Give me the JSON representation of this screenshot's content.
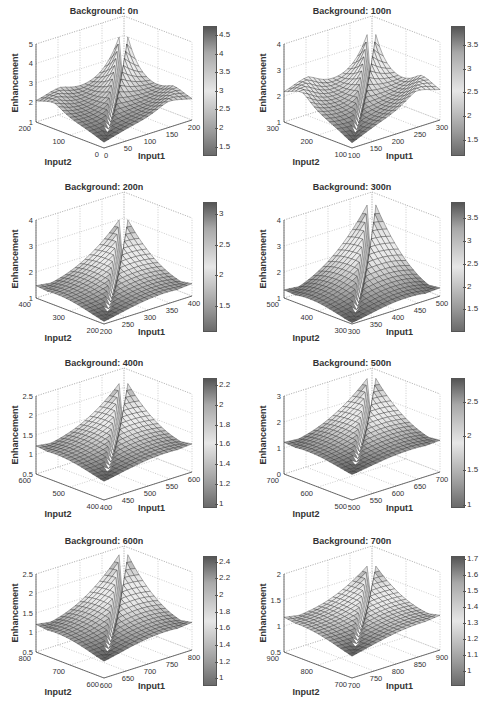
{
  "figure": {
    "panels": [
      {
        "title": "Background: 0n",
        "zlim": [
          1,
          5
        ],
        "zticks": [
          "1",
          "2",
          "3",
          "4",
          "5"
        ],
        "input1_ticks": [
          "0",
          "50",
          "100",
          "150",
          "200"
        ],
        "input2_ticks": [
          "0",
          "100",
          "200"
        ],
        "cbar_ticks": [
          "1.5",
          "2",
          "2.5",
          "3",
          "3.5",
          "4",
          "4.5"
        ],
        "cbar_range": [
          1.3,
          4.75
        ]
      },
      {
        "title": "Background: 100n",
        "zlim": [
          1,
          4
        ],
        "zticks": [
          "1",
          "2",
          "3",
          "4"
        ],
        "input1_ticks": [
          "100",
          "150",
          "200",
          "250",
          "300"
        ],
        "input2_ticks": [
          "100",
          "200",
          "300"
        ],
        "cbar_ticks": [
          "1.5",
          "2",
          "2.5",
          "3",
          "3.5"
        ],
        "cbar_range": [
          1.2,
          3.9
        ]
      },
      {
        "title": "Background: 200n",
        "zlim": [
          1,
          4
        ],
        "zticks": [
          "1",
          "2",
          "3",
          "4"
        ],
        "input1_ticks": [
          "200",
          "250",
          "300",
          "350",
          "400"
        ],
        "input2_ticks": [
          "200",
          "300",
          "400"
        ],
        "cbar_ticks": [
          "1.5",
          "2",
          "2.5",
          "3"
        ],
        "cbar_range": [
          1.1,
          3.2
        ]
      },
      {
        "title": "Background: 300n",
        "zlim": [
          1,
          4
        ],
        "zticks": [
          "1",
          "2",
          "3",
          "4"
        ],
        "input1_ticks": [
          "300",
          "350",
          "400",
          "450",
          "500"
        ],
        "input2_ticks": [
          "300",
          "400",
          "500"
        ],
        "cbar_ticks": [
          "1.5",
          "2",
          "2.5",
          "3",
          "3.5"
        ],
        "cbar_range": [
          1.05,
          3.85
        ]
      },
      {
        "title": "Background: 400n",
        "zlim": [
          0.5,
          2.5
        ],
        "zticks": [
          "0.5",
          "1",
          "1.5",
          "2",
          "2.5"
        ],
        "input1_ticks": [
          "400",
          "450",
          "500",
          "550",
          "600"
        ],
        "input2_ticks": [
          "400",
          "500",
          "600"
        ],
        "cbar_ticks": [
          "1",
          "1.2",
          "1.4",
          "1.6",
          "1.8",
          "2",
          "2.2"
        ],
        "cbar_range": [
          0.98,
          2.27
        ]
      },
      {
        "title": "Background: 500n",
        "zlim": [
          0,
          3
        ],
        "zticks": [
          "0",
          "1",
          "2",
          "3"
        ],
        "input1_ticks": [
          "500",
          "550",
          "600",
          "650",
          "700"
        ],
        "input2_ticks": [
          "500",
          "600",
          "700"
        ],
        "cbar_ticks": [
          "1",
          "1.5",
          "2",
          "2.5"
        ],
        "cbar_range": [
          0.98,
          2.85
        ]
      },
      {
        "title": "Background: 600n",
        "zlim": [
          0.5,
          2.5
        ],
        "zticks": [
          "0.5",
          "1",
          "1.5",
          "2",
          "2.5"
        ],
        "input1_ticks": [
          "600",
          "650",
          "700",
          "750",
          "800"
        ],
        "input2_ticks": [
          "600",
          "700",
          "800"
        ],
        "cbar_ticks": [
          "1",
          "1.2",
          "1.4",
          "1.6",
          "1.8",
          "2",
          "2.2",
          "2.4"
        ],
        "cbar_range": [
          0.93,
          2.47
        ]
      },
      {
        "title": "Background: 700n",
        "zlim": [
          0.5,
          2
        ],
        "zticks": [
          "0.5",
          "1",
          "1.5",
          "2"
        ],
        "input1_ticks": [
          "700",
          "750",
          "800",
          "850",
          "900"
        ],
        "input2_ticks": [
          "700",
          "800",
          "900"
        ],
        "cbar_ticks": [
          "1",
          "1.1",
          "1.2",
          "1.3",
          "1.4",
          "1.5",
          "1.6",
          "1.7"
        ],
        "cbar_range": [
          0.92,
          1.72
        ]
      }
    ],
    "axis_labels": {
      "x": "Input1",
      "y": "Input2",
      "z": "Enhancement"
    }
  },
  "chart_data": [
    {
      "type": "surface",
      "title": "Background: 0n",
      "xlabel": "Input1",
      "ylabel": "Input2",
      "zlabel": "Enhancement",
      "xlim": [
        0,
        200
      ],
      "ylim": [
        0,
        200
      ],
      "zlim": [
        1,
        5
      ],
      "peak_z": 4.75,
      "edge_z": 2.1,
      "min_z": 1.3,
      "colorbar": {
        "min": 1.3,
        "max": 4.75,
        "ticks": [
          1.5,
          2,
          2.5,
          3,
          3.5,
          4,
          4.5
        ]
      }
    },
    {
      "type": "surface",
      "title": "Background: 100n",
      "xlabel": "Input1",
      "ylabel": "Input2",
      "zlabel": "Enhancement",
      "xlim": [
        100,
        300
      ],
      "ylim": [
        100,
        300
      ],
      "zlim": [
        1,
        4
      ],
      "peak_z": 3.9,
      "edge_z": 2.2,
      "min_z": 1.2,
      "colorbar": {
        "min": 1.2,
        "max": 3.9,
        "ticks": [
          1.5,
          2,
          2.5,
          3,
          3.5
        ]
      }
    },
    {
      "type": "surface",
      "title": "Background: 200n",
      "xlabel": "Input1",
      "ylabel": "Input2",
      "zlabel": "Enhancement",
      "xlim": [
        200,
        400
      ],
      "ylim": [
        200,
        400
      ],
      "zlim": [
        1,
        4
      ],
      "peak_z": 3.2,
      "edge_z": 1.6,
      "min_z": 1.1,
      "colorbar": {
        "min": 1.1,
        "max": 3.2,
        "ticks": [
          1.5,
          2,
          2.5,
          3
        ]
      }
    },
    {
      "type": "surface",
      "title": "Background: 300n",
      "xlabel": "Input1",
      "ylabel": "Input2",
      "zlabel": "Enhancement",
      "xlim": [
        300,
        500
      ],
      "ylim": [
        300,
        500
      ],
      "zlim": [
        1,
        4
      ],
      "peak_z": 3.85,
      "edge_z": 1.4,
      "min_z": 1.05,
      "colorbar": {
        "min": 1.05,
        "max": 3.85,
        "ticks": [
          1.5,
          2,
          2.5,
          3,
          3.5
        ]
      }
    },
    {
      "type": "surface",
      "title": "Background: 400n",
      "xlabel": "Input1",
      "ylabel": "Input2",
      "zlabel": "Enhancement",
      "xlim": [
        400,
        600
      ],
      "ylim": [
        400,
        600
      ],
      "zlim": [
        0.5,
        2.5
      ],
      "peak_z": 2.27,
      "edge_z": 1.3,
      "min_z": 0.98,
      "colorbar": {
        "min": 0.98,
        "max": 2.27,
        "ticks": [
          1,
          1.2,
          1.4,
          1.6,
          1.8,
          2,
          2.2
        ]
      }
    },
    {
      "type": "surface",
      "title": "Background: 500n",
      "xlabel": "Input1",
      "ylabel": "Input2",
      "zlabel": "Enhancement",
      "xlim": [
        500,
        700
      ],
      "ylim": [
        500,
        700
      ],
      "zlim": [
        0,
        3
      ],
      "peak_z": 2.85,
      "edge_z": 1.3,
      "min_z": 0.98,
      "colorbar": {
        "min": 0.98,
        "max": 2.85,
        "ticks": [
          1,
          1.5,
          2,
          2.5
        ]
      }
    },
    {
      "type": "surface",
      "title": "Background: 600n",
      "xlabel": "Input1",
      "ylabel": "Input2",
      "zlabel": "Enhancement",
      "xlim": [
        600,
        800
      ],
      "ylim": [
        600,
        800
      ],
      "zlim": [
        0.5,
        2.5
      ],
      "peak_z": 2.47,
      "edge_z": 1.3,
      "min_z": 0.93,
      "colorbar": {
        "min": 0.93,
        "max": 2.47,
        "ticks": [
          1,
          1.2,
          1.4,
          1.6,
          1.8,
          2,
          2.2,
          2.4
        ]
      }
    },
    {
      "type": "surface",
      "title": "Background: 700n",
      "xlabel": "Input1",
      "ylabel": "Input2",
      "zlabel": "Enhancement",
      "xlim": [
        700,
        900
      ],
      "ylim": [
        700,
        900
      ],
      "zlim": [
        0.5,
        2
      ],
      "peak_z": 1.72,
      "edge_z": 1.25,
      "min_z": 0.92,
      "colorbar": {
        "min": 0.92,
        "max": 1.72,
        "ticks": [
          1,
          1.1,
          1.2,
          1.3,
          1.4,
          1.5,
          1.6,
          1.7
        ]
      }
    }
  ]
}
